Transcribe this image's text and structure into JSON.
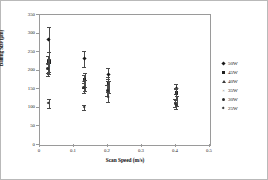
{
  "chart_data": {
    "type": "scatter",
    "title": "",
    "xlabel": "Scan Speed (m/s)",
    "ylabel": "Balling Size (μm)",
    "xlim": [
      0,
      0.5
    ],
    "ylim": [
      0,
      350
    ],
    "xticks": [
      "0",
      "0.1",
      "0.2",
      "0.3",
      "0.4",
      "0.5"
    ],
    "xtick_values": [
      0,
      0.1,
      0.2,
      0.3,
      0.4,
      0.5
    ],
    "yticks": [
      "0",
      "50",
      "100",
      "150",
      "200",
      "250",
      "300",
      "350"
    ],
    "ytick_values": [
      0,
      50,
      100,
      150,
      200,
      250,
      300,
      350
    ],
    "grid": false,
    "legend_position": "right-outside",
    "series": [
      {
        "name": "50W",
        "marker": "diamond",
        "points": [
          {
            "x": 0.025,
            "y": 285,
            "err_low": 35,
            "err_high": 33
          },
          {
            "x": 0.13,
            "y": 232,
            "err_low": 22,
            "err_high": 21
          },
          {
            "x": 0.2,
            "y": 190,
            "err_low": 18,
            "err_high": 16
          },
          {
            "x": 0.4,
            "y": 152,
            "err_low": 14,
            "err_high": 12
          }
        ]
      },
      {
        "name": "45W",
        "marker": "square",
        "points": [
          {
            "x": 0.025,
            "y": 224,
            "err_low": 28,
            "err_high": 26
          },
          {
            "x": 0.13,
            "y": 175,
            "err_low": 20,
            "err_high": 18
          },
          {
            "x": 0.2,
            "y": 165,
            "err_low": 22,
            "err_high": 18
          },
          {
            "x": 0.4,
            "y": 140,
            "err_low": 16,
            "err_high": 14
          }
        ]
      },
      {
        "name": "40W",
        "marker": "triangle",
        "points": [
          {
            "x": 0.025,
            "y": 218,
            "err_low": 24,
            "err_high": 22
          },
          {
            "x": 0.13,
            "y": 172,
            "err_low": 18,
            "err_high": 16
          },
          {
            "x": 0.2,
            "y": 163,
            "err_low": 20,
            "err_high": 16
          },
          {
            "x": 0.4,
            "y": 137,
            "err_low": 15,
            "err_high": 13
          }
        ]
      },
      {
        "name": "35W",
        "marker": "cross",
        "points": [
          {
            "x": 0.025,
            "y": 212,
            "err_low": 22,
            "err_high": 20
          },
          {
            "x": 0.13,
            "y": 162,
            "err_low": 16,
            "err_high": 14
          },
          {
            "x": 0.2,
            "y": 158,
            "err_low": 18,
            "err_high": 15
          },
          {
            "x": 0.4,
            "y": 120,
            "err_low": 14,
            "err_high": 12
          }
        ]
      },
      {
        "name": "30W",
        "marker": "circle",
        "points": [
          {
            "x": 0.025,
            "y": 205,
            "err_low": 18,
            "err_high": 16
          },
          {
            "x": 0.13,
            "y": 155,
            "err_low": 14,
            "err_high": 12
          },
          {
            "x": 0.2,
            "y": 148,
            "err_low": 16,
            "err_high": 14
          },
          {
            "x": 0.4,
            "y": 113,
            "err_low": 12,
            "err_high": 10
          }
        ]
      },
      {
        "name": "25W",
        "marker": "small-diamond",
        "points": [
          {
            "x": 0.025,
            "y": 112,
            "err_low": 12,
            "err_high": 11
          },
          {
            "x": 0.13,
            "y": 101,
            "err_low": 8,
            "err_high": 7
          },
          {
            "x": 0.2,
            "y": 130,
            "err_low": 14,
            "err_high": 12
          },
          {
            "x": 0.4,
            "y": 108,
            "err_low": 11,
            "err_high": 9
          }
        ]
      }
    ]
  }
}
